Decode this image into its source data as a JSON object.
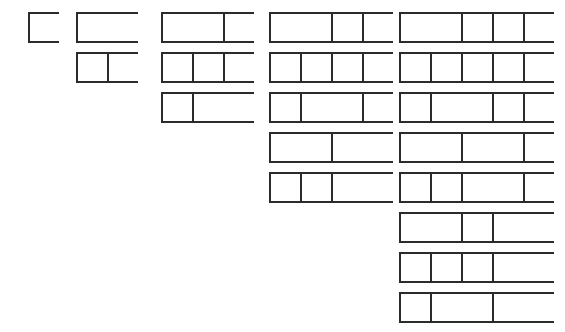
{
  "figure": {
    "name": "fibonacci-compositions-diagram",
    "type": "diagram",
    "background_color": "#ffffff",
    "stroke_color": "#2b2b2b",
    "fill_color": "#ffffff",
    "stroke_width_px": 2
  },
  "geometry": {
    "width_px": 565,
    "height_px": 332,
    "unit_cell_width_px": 31,
    "bar_height_px": 31,
    "row_pitch_px": 40,
    "first_row_top_px": 12,
    "column_left_px": [
      28,
      76,
      161,
      269,
      399
    ]
  },
  "columns": [
    {
      "index": 1,
      "n": 1,
      "count": 1,
      "left_px": 28,
      "rows": [
        {
          "parts": [
            1
          ],
          "total": 1
        }
      ]
    },
    {
      "index": 2,
      "n": 2,
      "count": 2,
      "left_px": 76,
      "rows": [
        {
          "parts": [
            2
          ],
          "total": 2
        },
        {
          "parts": [
            1,
            1
          ],
          "total": 2
        }
      ]
    },
    {
      "index": 3,
      "n": 3,
      "count": 3,
      "left_px": 161,
      "rows": [
        {
          "parts": [
            2,
            1
          ],
          "total": 3
        },
        {
          "parts": [
            1,
            1,
            1
          ],
          "total": 3
        },
        {
          "parts": [
            1,
            2
          ],
          "total": 3
        }
      ]
    },
    {
      "index": 4,
      "n": 4,
      "count": 5,
      "left_px": 269,
      "rows": [
        {
          "parts": [
            2,
            1,
            1
          ],
          "total": 4
        },
        {
          "parts": [
            1,
            1,
            1,
            1
          ],
          "total": 4
        },
        {
          "parts": [
            1,
            2,
            1
          ],
          "total": 4
        },
        {
          "parts": [
            2,
            2
          ],
          "total": 4
        },
        {
          "parts": [
            1,
            1,
            2
          ],
          "total": 4
        }
      ]
    },
    {
      "index": 5,
      "n": 5,
      "count": 8,
      "left_px": 399,
      "rows": [
        {
          "parts": [
            2,
            1,
            1,
            1
          ],
          "total": 5
        },
        {
          "parts": [
            1,
            1,
            1,
            1,
            1
          ],
          "total": 5
        },
        {
          "parts": [
            1,
            2,
            1,
            1
          ],
          "total": 5
        },
        {
          "parts": [
            2,
            2,
            1
          ],
          "total": 5
        },
        {
          "parts": [
            1,
            1,
            2,
            1
          ],
          "total": 5
        },
        {
          "parts": [
            2,
            1,
            2
          ],
          "total": 5
        },
        {
          "parts": [
            1,
            1,
            1,
            2
          ],
          "total": 5
        },
        {
          "parts": [
            1,
            2,
            2
          ],
          "total": 5
        }
      ]
    }
  ]
}
